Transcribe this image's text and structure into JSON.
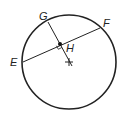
{
  "diagram": {
    "type": "circle-chord-geometry",
    "stroke_color": "#222222",
    "background": "#ffffff",
    "circle": {
      "cx": 69,
      "cy": 62,
      "r": 47
    },
    "center_mark": {
      "x": 69,
      "y": 62,
      "size": 4
    },
    "points": {
      "E": {
        "label": "E",
        "x": 23,
        "y": 62,
        "label_x": 10,
        "label_y": 66
      },
      "F": {
        "label": "F",
        "x": 100,
        "y": 28,
        "label_x": 103,
        "label_y": 27
      },
      "G": {
        "label": "G",
        "x": 48,
        "y": 22,
        "label_x": 39,
        "label_y": 20
      },
      "H": {
        "label": "H",
        "x": 60,
        "y": 44,
        "label_x": 66,
        "label_y": 52
      }
    },
    "segments": [
      {
        "name": "chord-EF",
        "from": "E",
        "to": "F"
      },
      {
        "name": "segment-GH-to-center",
        "from": "G",
        "to": "center"
      }
    ],
    "right_angle_at": "H"
  }
}
